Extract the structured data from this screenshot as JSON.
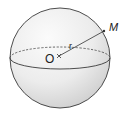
{
  "diagram": {
    "type": "sphere",
    "labels": {
      "center": "O",
      "point": "M",
      "radius": "r"
    },
    "colors": {
      "stroke": "#3a3a3a",
      "fill_light": "#f7f7f7",
      "fill_dark": "#d9d9d9"
    }
  }
}
